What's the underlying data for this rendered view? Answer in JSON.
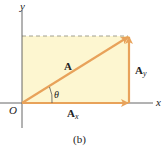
{
  "figure": {
    "caption": "(b)",
    "axes": {
      "x_label": "x",
      "y_label": "y",
      "origin_label": "O"
    },
    "vectors": {
      "main": {
        "label": "A"
      },
      "x_component": {
        "label": "A",
        "subscript": "x"
      },
      "y_component": {
        "label": "A",
        "subscript": "y"
      }
    },
    "angle_label": "θ",
    "colors": {
      "vector": "#e8a25a",
      "fill": "#fdf6d0",
      "axis": "#555555",
      "dashed": "#8a8a7a"
    }
  }
}
